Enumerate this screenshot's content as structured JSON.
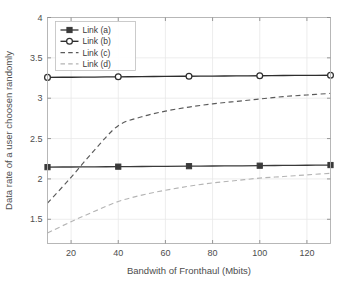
{
  "chart_data": {
    "type": "line",
    "title": "",
    "xlabel": "Bandwith of Fronthaul (Mbits)",
    "ylabel": "Data rate of a user choosen randomly",
    "xlim": [
      10,
      130
    ],
    "ylim": [
      1.2,
      4
    ],
    "xticks": [
      20,
      40,
      60,
      80,
      100,
      120
    ],
    "xticklabels": [
      "20",
      "40",
      "60",
      "80",
      "100",
      "120"
    ],
    "yticks": [
      1.5,
      2,
      2.5,
      3,
      3.5,
      4
    ],
    "yticklabels": [
      "1.5",
      "2",
      "2.5",
      "3",
      "3.5",
      "4"
    ],
    "grid": true,
    "legend_position": "upper-left",
    "x": [
      10,
      20,
      30,
      40,
      50,
      60,
      70,
      80,
      90,
      100,
      110,
      120,
      130
    ],
    "series": [
      {
        "name": "Link (a)",
        "style": "solid",
        "marker": "square-filled",
        "color": "#3a3a3a",
        "marker_x": [
          10,
          40,
          70,
          100,
          130
        ],
        "marker_values": [
          2.146,
          2.152,
          2.158,
          2.164,
          2.172
        ],
        "values": [
          2.146,
          2.148,
          2.15,
          2.152,
          2.154,
          2.156,
          2.158,
          2.16,
          2.162,
          2.164,
          2.167,
          2.17,
          2.172
        ]
      },
      {
        "name": "Link (b)",
        "style": "solid",
        "marker": "circle-open",
        "color": "#2e2e2e",
        "marker_x": [
          10,
          40,
          70,
          100,
          130
        ],
        "marker_values": [
          3.258,
          3.265,
          3.272,
          3.278,
          3.285
        ],
        "values": [
          3.258,
          3.26,
          3.262,
          3.265,
          3.267,
          3.27,
          3.272,
          3.274,
          3.276,
          3.278,
          3.281,
          3.283,
          3.285
        ]
      },
      {
        "name": "Link (c)",
        "style": "dashed",
        "marker": "none",
        "color": "#5a5a5a",
        "values": [
          1.7,
          2.02,
          2.36,
          2.66,
          2.77,
          2.84,
          2.89,
          2.93,
          2.96,
          2.99,
          3.02,
          3.04,
          3.06
        ]
      },
      {
        "name": "Link (d)",
        "style": "dashed",
        "marker": "none",
        "color": "#b4b4b4",
        "values": [
          1.33,
          1.47,
          1.6,
          1.72,
          1.8,
          1.86,
          1.91,
          1.95,
          1.98,
          2.01,
          2.03,
          2.05,
          2.07
        ]
      }
    ]
  }
}
